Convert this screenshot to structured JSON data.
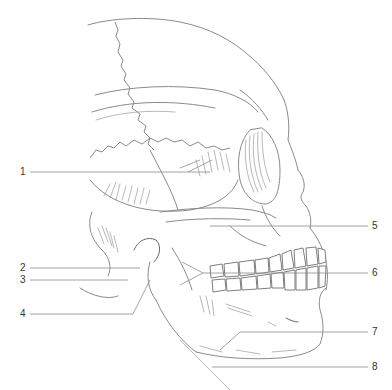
{
  "diagram": {
    "background": "#ffffff",
    "line_color": "#8a8a8a",
    "label_color": "#333333",
    "labels": [
      {
        "id": 1,
        "text": "1",
        "side": "left",
        "label_x": 20,
        "label_y": 173,
        "line": [
          [
            30,
            172
          ],
          [
            210,
            172
          ]
        ]
      },
      {
        "id": 2,
        "text": "2",
        "side": "left",
        "label_x": 20,
        "label_y": 268,
        "line": [
          [
            30,
            268
          ],
          [
            140,
            268
          ]
        ]
      },
      {
        "id": 3,
        "text": "3",
        "side": "left",
        "label_x": 20,
        "label_y": 280,
        "line": [
          [
            30,
            280
          ],
          [
            128,
            280
          ]
        ]
      },
      {
        "id": 4,
        "text": "4",
        "side": "left",
        "label_x": 20,
        "label_y": 314,
        "line": [
          [
            30,
            314
          ],
          [
            133,
            314
          ],
          [
            150,
            280
          ]
        ]
      },
      {
        "id": 5,
        "text": "5",
        "side": "right",
        "label_x": 372,
        "label_y": 226,
        "line": [
          [
            210,
            226
          ],
          [
            368,
            226
          ]
        ]
      },
      {
        "id": 6,
        "text": "6",
        "side": "right",
        "label_x": 372,
        "label_y": 270,
        "line": [
          [
            180,
            285
          ],
          [
            203,
            273
          ],
          [
            368,
            273
          ]
        ]
      },
      {
        "id": 7,
        "text": "7",
        "side": "right",
        "label_x": 372,
        "label_y": 332,
        "line": [
          [
            220,
            350
          ],
          [
            240,
            332
          ],
          [
            368,
            332
          ]
        ]
      },
      {
        "id": 8,
        "text": "8",
        "side": "right",
        "label_x": 372,
        "label_y": 367,
        "line": [
          [
            212,
            367
          ],
          [
            368,
            367
          ]
        ]
      }
    ]
  }
}
